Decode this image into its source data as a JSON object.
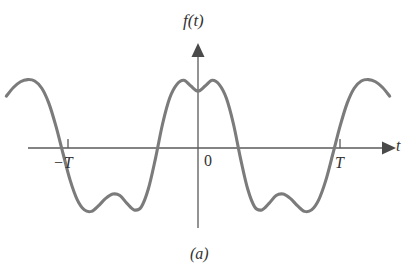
{
  "figure": {
    "caption": "(a)",
    "axis_labels": {
      "y": "f(t)",
      "x": "t"
    },
    "tick_labels": {
      "left": "−T",
      "origin": "0",
      "right": "T"
    },
    "colors": {
      "curve": "#7b7b7b",
      "axis": "#5a5a5a",
      "text": "#333333",
      "background": "#ffffff"
    }
  },
  "chart_data": {
    "type": "line",
    "title": "",
    "subtitle": "",
    "xlabel": "t",
    "ylabel": "f(t)",
    "caption": "(a)",
    "grid": false,
    "legend": null,
    "xlim": [
      -1.45,
      1.45
    ],
    "ylim": [
      -1.25,
      1.25
    ],
    "xticks": [
      -1,
      0,
      1
    ],
    "xticklabels": [
      "−T",
      "0",
      "T"
    ],
    "yticks": [],
    "yticklabels": [],
    "series": [
      {
        "name": "f(t)",
        "color": "#7b7b7b",
        "x": [
          -1.35,
          -1.3,
          -1.25,
          -1.2,
          -1.15,
          -1.1,
          -1.05,
          -1.0,
          -0.95,
          -0.9,
          -0.85,
          -0.8,
          -0.75,
          -0.7,
          -0.65,
          -0.6,
          -0.55,
          -0.5,
          -0.45,
          -0.4,
          -0.35,
          -0.3,
          -0.25,
          -0.2,
          -0.15,
          -0.1,
          -0.05,
          0.0,
          0.05,
          0.1,
          0.15,
          0.2,
          0.25,
          0.3,
          0.35,
          0.4,
          0.45,
          0.5,
          0.55,
          0.6,
          0.65,
          0.7,
          0.75,
          0.8,
          0.85,
          0.9,
          0.95,
          1.0,
          1.05,
          1.1,
          1.15,
          1.2,
          1.25,
          1.3,
          1.35
        ],
        "y": [
          0.72,
          0.84,
          0.92,
          0.95,
          0.93,
          0.83,
          0.62,
          0.3,
          -0.08,
          -0.45,
          -0.72,
          -0.86,
          -0.88,
          -0.8,
          -0.7,
          -0.64,
          -0.66,
          -0.77,
          -0.86,
          -0.82,
          -0.57,
          -0.15,
          0.33,
          0.69,
          0.88,
          0.94,
          0.86,
          0.79,
          0.86,
          0.94,
          0.88,
          0.69,
          0.33,
          -0.15,
          -0.57,
          -0.82,
          -0.86,
          -0.77,
          -0.66,
          -0.64,
          -0.7,
          -0.8,
          -0.88,
          -0.86,
          -0.72,
          -0.45,
          -0.08,
          0.3,
          0.62,
          0.83,
          0.93,
          0.95,
          0.92,
          0.84,
          0.72
        ]
      }
    ],
    "axes_style": {
      "spines": "centered-arrows",
      "x_axis_arrow": true,
      "y_axis_arrow": true,
      "tick_direction": "up"
    }
  },
  "geometry": {
    "origin_px": {
      "x": 198,
      "y": 148
    },
    "x_scale_px_per_T": 142,
    "y_scale_px_per_unit": 72,
    "x_axis_left_px": 28,
    "x_axis_right_px": 392,
    "y_axis_top_px": 44,
    "y_axis_bottom_px": 228,
    "tick_half_height_px": 9
  }
}
